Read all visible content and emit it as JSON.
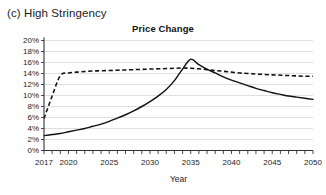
{
  "panel": {
    "caption": "(c) High Stringency"
  },
  "chart_data": {
    "type": "line",
    "title": "Price Change",
    "xlabel": "Year",
    "ylabel": "",
    "xlim": [
      2017,
      2050
    ],
    "ylim": [
      0,
      20
    ],
    "grid": true,
    "legend": "none",
    "ytick_labels": [
      "0%",
      "2%",
      "4%",
      "6%",
      "8%",
      "10%",
      "12%",
      "14%",
      "16%",
      "18%",
      "20%"
    ],
    "ytick_values": [
      0,
      2,
      4,
      6,
      8,
      10,
      12,
      14,
      16,
      18,
      20
    ],
    "xtick_labels": [
      "2017",
      "2020",
      "2025",
      "2030",
      "2035",
      "2040",
      "2045",
      "2050"
    ],
    "xtick_values": [
      2017,
      2020,
      2025,
      2030,
      2035,
      2040,
      2045,
      2050
    ],
    "x": [
      2017,
      2018,
      2019,
      2020,
      2021,
      2022,
      2023,
      2024,
      2025,
      2026,
      2027,
      2028,
      2029,
      2030,
      2031,
      2032,
      2033,
      2034,
      2035,
      2036,
      2037,
      2038,
      2039,
      2040,
      2041,
      2042,
      2043,
      2044,
      2045,
      2046,
      2047,
      2048,
      2049,
      2050
    ],
    "series": [
      {
        "name": "solid-series",
        "style": "solid",
        "color": "#111111",
        "values": [
          2.7,
          2.9,
          3.1,
          3.4,
          3.7,
          4.0,
          4.4,
          4.8,
          5.3,
          5.9,
          6.5,
          7.2,
          8.0,
          8.9,
          9.9,
          11.1,
          12.7,
          14.8,
          16.6,
          15.6,
          14.8,
          14.1,
          13.4,
          12.8,
          12.3,
          11.8,
          11.3,
          10.9,
          10.5,
          10.2,
          9.9,
          9.7,
          9.5,
          9.3
        ]
      },
      {
        "name": "dashed-series",
        "style": "dashed",
        "color": "#111111",
        "values": [
          5.8,
          9.9,
          13.6,
          14.1,
          14.25,
          14.35,
          14.45,
          14.5,
          14.55,
          14.6,
          14.65,
          14.7,
          14.75,
          14.8,
          14.85,
          14.9,
          14.95,
          15.0,
          14.95,
          14.85,
          14.7,
          14.55,
          14.4,
          14.25,
          14.1,
          14.0,
          13.9,
          13.82,
          13.75,
          13.7,
          13.62,
          13.56,
          13.5,
          13.5
        ]
      }
    ],
    "annotations": {
      "solid_peak_year": 2035,
      "solid_peak_value": 16.6,
      "crossover_year": 2036,
      "crossover_value": 14.9
    }
  }
}
